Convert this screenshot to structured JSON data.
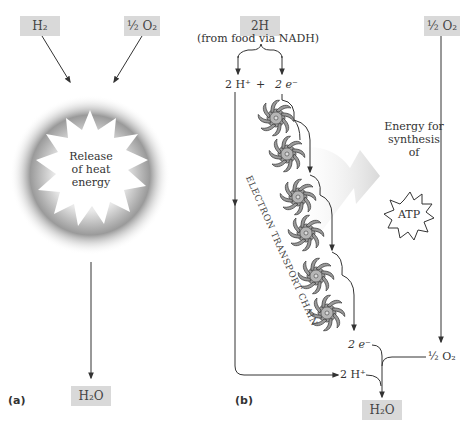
{
  "panel_a": {
    "label": "(a)",
    "inputs": {
      "h2": "H₂",
      "half_o2": "½ O₂"
    },
    "center_text": [
      "Release",
      "of heat",
      "energy"
    ],
    "output": "H₂O"
  },
  "panel_b": {
    "label": "(b)",
    "input_2h": "2H",
    "source_note": "(from food via NADH)",
    "split_protons": "2 H⁺",
    "plus": "+",
    "split_electrons": "2 e⁻",
    "half_o2_top": "½ O₂",
    "chain_label": "ELECTRON TRANSPORT CHAIN",
    "energy_text": [
      "Energy for",
      "synthesis",
      "of"
    ],
    "atp": "ATP",
    "bottom_electrons": "2 e⁻",
    "bottom_protons": "2 H⁺",
    "bottom_half_o2": "½ O₂",
    "output": "H₂O",
    "gear_count": 6
  },
  "colors": {
    "label_box": "#d9d9d9",
    "line": "#555555",
    "gear_fill": "#9a9a9a",
    "glow": "#8c8c8c"
  }
}
